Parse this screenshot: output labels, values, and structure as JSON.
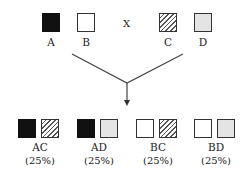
{
  "parents": {
    "left": [
      {
        "label": "A",
        "fill": "black"
      },
      {
        "label": "B",
        "fill": "white"
      }
    ],
    "cross_symbol": "X",
    "right": [
      {
        "label": "C",
        "fill": "hatched"
      },
      {
        "label": "D",
        "fill": "gray"
      }
    ]
  },
  "offspring": [
    {
      "label": "AC",
      "percent": "(25%)",
      "fills": [
        "black",
        "hatched"
      ]
    },
    {
      "label": "AD",
      "percent": "(25%)",
      "fills": [
        "black",
        "gray"
      ]
    },
    {
      "label": "BC",
      "percent": "(25%)",
      "fills": [
        "white",
        "hatched"
      ]
    },
    {
      "label": "BD",
      "percent": "(25%)",
      "fills": [
        "white",
        "gray"
      ]
    }
  ],
  "colors": {
    "black": "#111111",
    "gray": "#e4e4e4",
    "line": "#444444"
  }
}
